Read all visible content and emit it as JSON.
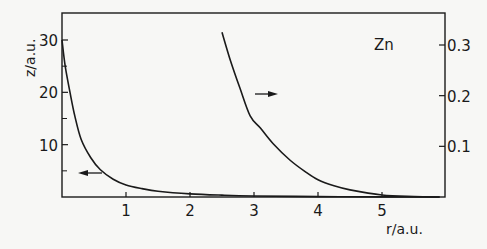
{
  "chart_data": {
    "type": "line",
    "title": "",
    "annotation": "Zn",
    "xlabel": "r/a.u.",
    "ylabel_left": "z/a.u.",
    "ylabel_right": "",
    "xlim": [
      0,
      5.9
    ],
    "ylim_left": [
      0,
      35
    ],
    "ylim_right": [
      0,
      0.36
    ],
    "x_ticks": [
      1,
      2,
      3,
      4,
      5
    ],
    "x_tick_labels": [
      "1",
      "2",
      "3",
      "4",
      "5"
    ],
    "y_left_ticks": [
      10,
      20,
      30
    ],
    "y_left_tick_labels": [
      "10",
      "20",
      "30"
    ],
    "y_left_minor_ticks": [
      5,
      15,
      25
    ],
    "y_right_ticks": [
      0.1,
      0.2,
      0.3
    ],
    "y_right_tick_labels": [
      "0.1",
      "0.2",
      "0.3"
    ],
    "grid": false,
    "legend": "none (arrows indicate axis: left arrow → left axis, right arrow → right axis)",
    "series": [
      {
        "name": "z(r) (left axis)",
        "axis": "left",
        "arrow": "left",
        "x": [
          0.0,
          0.05,
          0.125,
          0.2,
          0.3,
          0.45,
          0.6,
          0.8,
          1.0,
          1.25,
          1.5,
          2.0,
          2.5,
          3.0,
          4.0,
          5.0,
          5.9
        ],
        "y": [
          30,
          25,
          20,
          15.5,
          11,
          7.5,
          5.2,
          3.4,
          2.3,
          1.6,
          1.1,
          0.6,
          0.35,
          0.2,
          0.08,
          0.03,
          0.01
        ]
      },
      {
        "name": "z(r) scaled (right axis)",
        "axis": "right",
        "arrow": "right",
        "x": [
          2.5,
          2.63,
          2.78,
          2.94,
          3.1,
          3.3,
          3.56,
          3.8,
          4.0,
          4.25,
          4.5,
          5.0,
          5.5,
          5.9
        ],
        "y": [
          0.325,
          0.27,
          0.215,
          0.16,
          0.136,
          0.105,
          0.073,
          0.05,
          0.034,
          0.022,
          0.014,
          0.004,
          0.001,
          0.0
        ]
      }
    ]
  }
}
